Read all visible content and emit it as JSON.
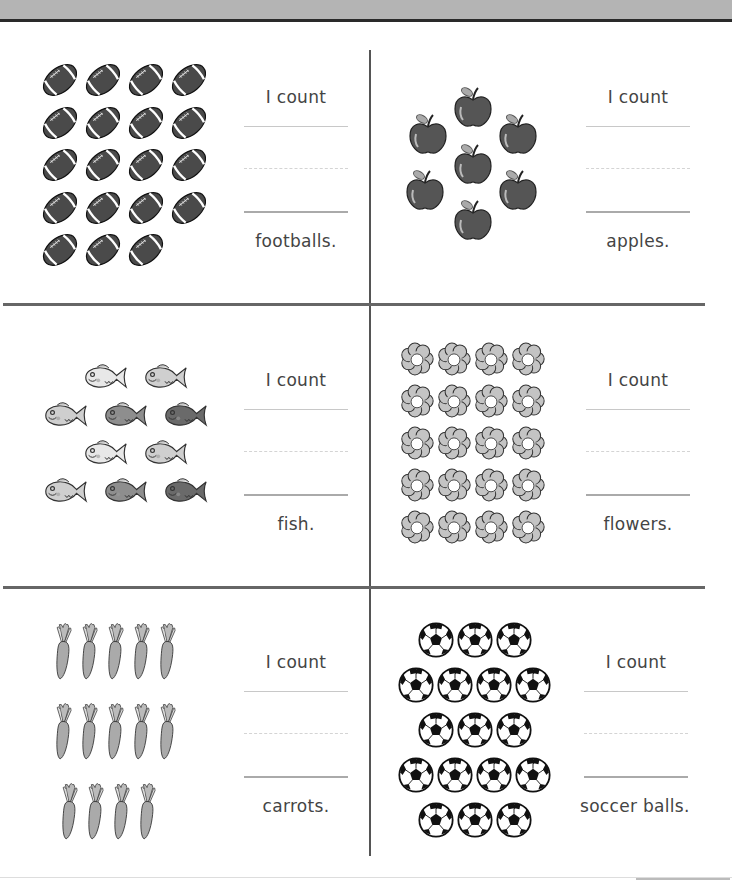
{
  "worksheet": {
    "prompt": "I count",
    "sections": [
      {
        "id": "footballs",
        "item": "football",
        "label": "footballs.",
        "count": 19,
        "rows": [
          4,
          4,
          4,
          4,
          3
        ]
      },
      {
        "id": "apples",
        "item": "apple",
        "label": "apples.",
        "count": 7,
        "rows": [
          1,
          2,
          1,
          2,
          1
        ]
      },
      {
        "id": "fish",
        "item": "fish",
        "label": "fish.",
        "count": 10,
        "rows": [
          2,
          3,
          2,
          3
        ]
      },
      {
        "id": "flowers",
        "item": "flower",
        "label": "flowers.",
        "count": 20,
        "rows": [
          4,
          4,
          4,
          4,
          4
        ]
      },
      {
        "id": "carrots",
        "item": "carrot",
        "label": "carrots.",
        "count": 14,
        "rows": [
          5,
          5,
          4
        ]
      },
      {
        "id": "soccer-balls",
        "item": "soccer-ball",
        "label": "soccer balls.",
        "count": 17,
        "rows": [
          3,
          4,
          3,
          4,
          3
        ]
      }
    ]
  },
  "colors": {
    "header": "#b4b4b4",
    "rule": "#2a2a2a",
    "divider": "#666666",
    "text": "#444444"
  }
}
